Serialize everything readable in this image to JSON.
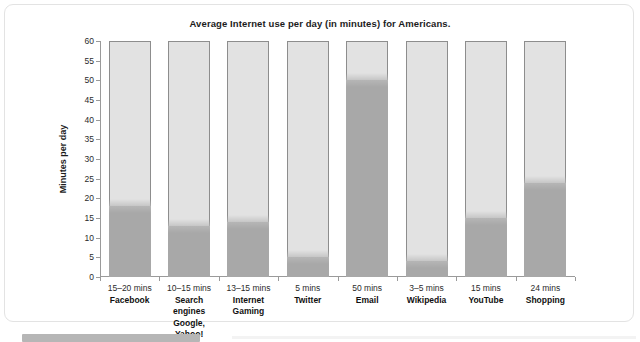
{
  "card": {
    "title": "Average Internet use per day (in minutes) for Americans."
  },
  "chart_data": {
    "type": "bar",
    "title": "Average Internet use per day (in minutes) for Americans.",
    "xlabel": "",
    "ylabel": "Minutes per day",
    "ylim": [
      0,
      60
    ],
    "ytick_step": 5,
    "yticks": [
      "0",
      "5",
      "10",
      "15",
      "20",
      "25",
      "30",
      "35",
      "40",
      "45",
      "50",
      "55",
      "60"
    ],
    "grid": false,
    "legend": "none",
    "track_max": 60,
    "categories": [
      "Facebook",
      "Search engines",
      "Internet Gaming",
      "Twitter",
      "Email",
      "Wikipedia",
      "YouTube",
      "Shopping"
    ],
    "values": [
      18,
      13,
      14,
      5,
      50,
      4,
      15,
      24
    ],
    "value_labels": [
      "15–20 mins",
      "10–15 mins",
      "13–15 mins",
      "5 mins",
      "50 mins",
      "3–5 mins",
      "15 mins",
      "24 mins"
    ],
    "bars": [
      {
        "mins": "15–20 mins",
        "name": "Facebook",
        "name2": "",
        "value": 18
      },
      {
        "mins": "10–15 mins",
        "name": "Search engines",
        "name2": "Google, Yahoo!",
        "value": 13
      },
      {
        "mins": "13–15 mins",
        "name": "Internet",
        "name2": "Gaming",
        "value": 14
      },
      {
        "mins": "5 mins",
        "name": "Twitter",
        "name2": "",
        "value": 5
      },
      {
        "mins": "50 mins",
        "name": "Email",
        "name2": "",
        "value": 50
      },
      {
        "mins": "3–5 mins",
        "name": "Wikipedia",
        "name2": "",
        "value": 4
      },
      {
        "mins": "15 mins",
        "name": "YouTube",
        "name2": "",
        "value": 15
      },
      {
        "mins": "24 mins",
        "name": "Shopping",
        "name2": "",
        "value": 24
      }
    ],
    "colors": {
      "track": "#e2e2e2",
      "fill": "#a8a8a8",
      "outline": "#8d8d8d",
      "axis": "#9a9a9a",
      "text": "#1c1c1c"
    }
  }
}
